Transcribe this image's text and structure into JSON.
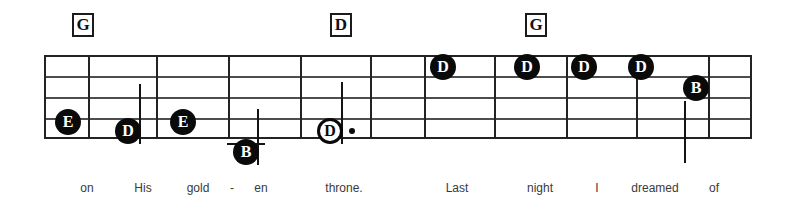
{
  "document": {
    "type": "music-notation-excerpt",
    "title": "Lead sheet staff excerpt with chord symbols and lyrics"
  },
  "colors": {
    "ink": "#0a0a0a",
    "staff_line": "#4d4d4d",
    "barline": "#232323",
    "lyric_text": "#3a3a3a",
    "page_background": "#ffffff",
    "notehead_fill": "#0a0a0a",
    "notehead_label": "#ffffff"
  },
  "staff": {
    "left": 44,
    "right": 750,
    "top": 55,
    "bottom": 137,
    "line_count": 5,
    "line_y": [
      55,
      76,
      97,
      118,
      137
    ],
    "barlines_x": [
      88,
      156,
      228,
      300,
      370,
      424,
      494,
      566,
      636,
      708
    ]
  },
  "chords": [
    {
      "label": "G",
      "x": 72,
      "y": 13
    },
    {
      "label": "D",
      "x": 330,
      "y": 13
    },
    {
      "label": "G",
      "x": 525,
      "y": 13
    }
  ],
  "notes": [
    {
      "pitch": "E",
      "head": "filled",
      "x": 68,
      "y": 122,
      "stem": "up",
      "stem_height": 0,
      "ledger": false,
      "dotted": false
    },
    {
      "pitch": "D",
      "head": "filled",
      "x": 128,
      "y": 131,
      "stem": "up",
      "stem_height": 60,
      "ledger": false,
      "dotted": false
    },
    {
      "pitch": "E",
      "head": "filled",
      "x": 183,
      "y": 122,
      "stem": "none",
      "stem_height": 0,
      "ledger": false,
      "dotted": false
    },
    {
      "pitch": "B",
      "head": "filled",
      "x": 246,
      "y": 152,
      "stem": "up",
      "stem_height": 56,
      "ledger": true,
      "dotted": false
    },
    {
      "pitch": "D",
      "head": "hollow",
      "x": 330,
      "y": 131,
      "stem": "up",
      "stem_height": 62,
      "ledger": false,
      "dotted": true
    },
    {
      "pitch": "D",
      "head": "filled",
      "x": 443,
      "y": 67,
      "stem": "none",
      "stem_height": 0,
      "ledger": false,
      "dotted": false
    },
    {
      "pitch": "D",
      "head": "filled",
      "x": 527,
      "y": 67,
      "stem": "none",
      "stem_height": 0,
      "ledger": false,
      "dotted": false
    },
    {
      "pitch": "D",
      "head": "filled",
      "x": 584,
      "y": 67,
      "stem": "none",
      "stem_height": 0,
      "ledger": false,
      "dotted": false
    },
    {
      "pitch": "D",
      "head": "filled",
      "x": 641,
      "y": 67,
      "stem": "none",
      "stem_height": 0,
      "ledger": false,
      "dotted": false
    },
    {
      "pitch": "B",
      "head": "filled",
      "x": 696,
      "y": 88,
      "stem": "down",
      "stem_height": 62,
      "ledger": false,
      "dotted": false
    }
  ],
  "lyrics": [
    {
      "text": "on",
      "x": 87
    },
    {
      "text": "His",
      "x": 143
    },
    {
      "text": "gold",
      "x": 198
    },
    {
      "text": "-",
      "x": 232
    },
    {
      "text": "en",
      "x": 261
    },
    {
      "text": "throne.",
      "x": 344
    },
    {
      "text": "Last",
      "x": 457
    },
    {
      "text": "night",
      "x": 540
    },
    {
      "text": "I",
      "x": 597
    },
    {
      "text": "dreamed",
      "x": 655
    },
    {
      "text": "of",
      "x": 714
    }
  ]
}
